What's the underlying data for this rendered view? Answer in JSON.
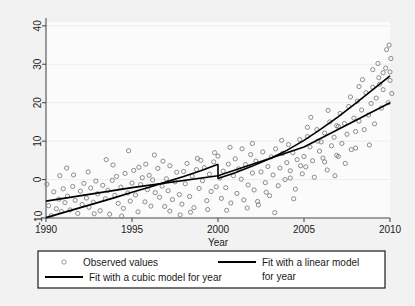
{
  "chart_data": {
    "type": "scatter",
    "title": "",
    "xlabel": "Year",
    "ylabel": "",
    "xlim": [
      1990,
      2010
    ],
    "ylim": [
      -10,
      41
    ],
    "grid": true,
    "grid_axis": "y",
    "legend_position": "bottom",
    "xticks": [
      1990,
      1995,
      2000,
      2005,
      2010
    ],
    "xtick_labels": [
      "1990",
      "1995",
      "2000",
      "2005",
      "2010"
    ],
    "yticks": [
      -10,
      0,
      10,
      20,
      30,
      40
    ],
    "ytick_labels": [
      "-10",
      "0",
      "10",
      "20",
      "30",
      "40"
    ],
    "series": [
      {
        "name": "Observed values",
        "type": "scatter",
        "marker": "open-circle",
        "color": "#808080",
        "points": [
          [
            1990.05,
            -1.2
          ],
          [
            1990.15,
            -6.8
          ],
          [
            1990.3,
            -9.4
          ],
          [
            1990.45,
            -3.2
          ],
          [
            1990.6,
            -7.6
          ],
          [
            1990.75,
            -5.1
          ],
          [
            1990.9,
            -8.3
          ],
          [
            1991.0,
            -2.4
          ],
          [
            1991.1,
            -6.0
          ],
          [
            1991.25,
            -4.3
          ],
          [
            1991.4,
            -7.9
          ],
          [
            1991.55,
            -1.8
          ],
          [
            1991.7,
            -5.4
          ],
          [
            1991.85,
            -8.8
          ],
          [
            1992.0,
            -3.0
          ],
          [
            1992.1,
            -6.5
          ],
          [
            1992.2,
            -1.0
          ],
          [
            1992.35,
            -4.8
          ],
          [
            1992.5,
            -7.2
          ],
          [
            1992.6,
            -2.2
          ],
          [
            1992.75,
            -5.9
          ],
          [
            1992.9,
            -0.4
          ],
          [
            1993.0,
            -3.7
          ],
          [
            1993.15,
            -8.1
          ],
          [
            1993.3,
            -1.5
          ],
          [
            1993.45,
            -5.0
          ],
          [
            1993.6,
            -2.8
          ],
          [
            1993.7,
            -9.0
          ],
          [
            1993.85,
            -0.2
          ],
          [
            1994.0,
            -4.1
          ],
          [
            1994.1,
            0.8
          ],
          [
            1994.2,
            -6.2
          ],
          [
            1994.35,
            -2.0
          ],
          [
            1994.5,
            -7.5
          ],
          [
            1994.6,
            1.6
          ],
          [
            1994.75,
            -3.5
          ],
          [
            1994.9,
            -5.6
          ],
          [
            1995.0,
            -0.9
          ],
          [
            1995.1,
            2.4
          ],
          [
            1995.2,
            -4.0
          ],
          [
            1995.35,
            -8.4
          ],
          [
            1995.5,
            -1.3
          ],
          [
            1995.6,
            0.5
          ],
          [
            1995.75,
            -5.8
          ],
          [
            1995.9,
            -2.6
          ],
          [
            1996.0,
            1.1
          ],
          [
            1996.1,
            -6.9
          ],
          [
            1996.2,
            -0.1
          ],
          [
            1996.35,
            -3.4
          ],
          [
            1996.5,
            2.9
          ],
          [
            1996.6,
            -4.6
          ],
          [
            1996.75,
            -1.7
          ],
          [
            1996.9,
            -7.0
          ],
          [
            1997.0,
            0.2
          ],
          [
            1997.1,
            -2.9
          ],
          [
            1997.2,
            3.6
          ],
          [
            1997.35,
            -5.2
          ],
          [
            1997.5,
            -0.6
          ],
          [
            1997.6,
            1.9
          ],
          [
            1997.75,
            -3.9
          ],
          [
            1997.9,
            -6.4
          ],
          [
            1998.0,
            2.1
          ],
          [
            1998.1,
            -1.1
          ],
          [
            1998.2,
            4.2
          ],
          [
            1998.35,
            -4.4
          ],
          [
            1998.5,
            0.9
          ],
          [
            1998.6,
            -7.3
          ],
          [
            1998.75,
            2.6
          ],
          [
            1998.9,
            -2.3
          ],
          [
            1999.0,
            5.0
          ],
          [
            1999.1,
            -0.3
          ],
          [
            1999.2,
            3.1
          ],
          [
            1999.35,
            -5.5
          ],
          [
            1999.5,
            1.4
          ],
          [
            1999.6,
            -3.1
          ],
          [
            1999.75,
            4.6
          ],
          [
            1999.9,
            -1.9
          ],
          [
            2000.0,
            6.1
          ],
          [
            2000.1,
            0.4
          ],
          [
            2000.2,
            -4.9
          ],
          [
            2000.3,
            2.2
          ],
          [
            2000.45,
            -2.1
          ],
          [
            2000.6,
            4.0
          ],
          [
            2000.75,
            -6.1
          ],
          [
            2000.9,
            1.0
          ],
          [
            2001.0,
            5.4
          ],
          [
            2001.1,
            -3.6
          ],
          [
            2001.2,
            2.8
          ],
          [
            2001.35,
            0.1
          ],
          [
            2001.5,
            -5.3
          ],
          [
            2001.6,
            3.9
          ],
          [
            2001.75,
            -1.4
          ],
          [
            2001.9,
            6.5
          ],
          [
            2002.0,
            1.7
          ],
          [
            2002.1,
            -2.7
          ],
          [
            2002.2,
            4.8
          ],
          [
            2002.35,
            -6.6
          ],
          [
            2002.5,
            2.0
          ],
          [
            2002.6,
            7.2
          ],
          [
            2002.75,
            -0.8
          ],
          [
            2002.9,
            3.4
          ],
          [
            2003.0,
            -4.2
          ],
          [
            2003.1,
            5.9
          ],
          [
            2003.2,
            1.2
          ],
          [
            2003.35,
            8.0
          ],
          [
            2003.5,
            -1.6
          ],
          [
            2003.6,
            3.0
          ],
          [
            2003.75,
            6.8
          ],
          [
            2003.9,
            0.0
          ],
          [
            2004.0,
            4.4
          ],
          [
            2004.1,
            9.1
          ],
          [
            2004.2,
            2.3
          ],
          [
            2004.35,
            7.0
          ],
          [
            2004.5,
            -2.5
          ],
          [
            2004.6,
            5.2
          ],
          [
            2004.75,
            10.4
          ],
          [
            2004.9,
            1.5
          ],
          [
            2005.0,
            6.0
          ],
          [
            2005.1,
            3.3
          ],
          [
            2005.2,
            11.2
          ],
          [
            2005.35,
            8.5
          ],
          [
            2005.5,
            4.9
          ],
          [
            2005.6,
            0.6
          ],
          [
            2005.75,
            13.0
          ],
          [
            2005.9,
            7.4
          ],
          [
            2006.0,
            9.8
          ],
          [
            2006.1,
            5.6
          ],
          [
            2006.2,
            12.1
          ],
          [
            2006.35,
            2.5
          ],
          [
            2006.5,
            15.0
          ],
          [
            2006.6,
            8.8
          ],
          [
            2006.75,
            11.0
          ],
          [
            2006.9,
            6.3
          ],
          [
            2007.0,
            13.8
          ],
          [
            2007.1,
            17.2
          ],
          [
            2007.2,
            9.4
          ],
          [
            2007.35,
            14.6
          ],
          [
            2007.5,
            11.8
          ],
          [
            2007.6,
            19.0
          ],
          [
            2007.75,
            7.8
          ],
          [
            2007.9,
            16.0
          ],
          [
            2008.0,
            12.5
          ],
          [
            2008.1,
            20.4
          ],
          [
            2008.2,
            15.2
          ],
          [
            2008.35,
            18.1
          ],
          [
            2008.5,
            13.0
          ],
          [
            2008.6,
            22.6
          ],
          [
            2008.75,
            16.8
          ],
          [
            2008.9,
            19.8
          ],
          [
            2009.0,
            24.0
          ],
          [
            2009.1,
            14.5
          ],
          [
            2009.2,
            21.2
          ],
          [
            2009.35,
            26.5
          ],
          [
            2009.5,
            18.6
          ],
          [
            2009.6,
            23.4
          ],
          [
            2009.75,
            29.0
          ],
          [
            2009.9,
            20.0
          ],
          [
            2010.0,
            25.8
          ],
          [
            2010.05,
            31.5
          ],
          [
            2010.1,
            22.4
          ],
          [
            1991.2,
            3.0
          ],
          [
            1993.5,
            5.2
          ],
          [
            1994.8,
            7.5
          ],
          [
            1996.3,
            6.4
          ],
          [
            1997.8,
            -9.2
          ],
          [
            1999.4,
            -7.8
          ],
          [
            2001.7,
            -7.4
          ],
          [
            2003.3,
            -8.6
          ],
          [
            2004.4,
            -5.0
          ],
          [
            2002.8,
            -3.3
          ],
          [
            2000.5,
            -8.0
          ],
          [
            2006.8,
            1.0
          ],
          [
            2007.4,
            4.2
          ],
          [
            2008.8,
            9.0
          ],
          [
            2009.8,
            33.8
          ],
          [
            2009.95,
            35.0
          ],
          [
            2009.3,
            30.2
          ],
          [
            2008.4,
            26.0
          ],
          [
            2007.7,
            21.5
          ],
          [
            2006.4,
            18.0
          ],
          [
            2005.4,
            16.2
          ],
          [
            2009.6,
            27.8
          ],
          [
            2008.2,
            24.2
          ],
          [
            2009.0,
            28.6
          ],
          [
            2006.9,
            14.0
          ],
          [
            2005.8,
            10.0
          ],
          [
            2010.0,
            28.0
          ],
          [
            2009.4,
            24.8
          ],
          [
            1992.45,
            2.0
          ],
          [
            1995.8,
            4.0
          ],
          [
            1998.8,
            5.5
          ],
          [
            2002.3,
            -5.7
          ],
          [
            2004.8,
            3.6
          ],
          [
            2001.4,
            8.0
          ],
          [
            1999.8,
            7.0
          ],
          [
            1993.9,
            3.8
          ],
          [
            1991.6,
            1.2
          ],
          [
            1996.8,
            4.8
          ],
          [
            2003.7,
            10.2
          ],
          [
            2005.2,
            13.6
          ],
          [
            2007.0,
            6.0
          ],
          [
            2008.0,
            8.2
          ],
          [
            2006.2,
            4.6
          ],
          [
            2004.2,
            0.4
          ],
          [
            1990.8,
            1.0
          ],
          [
            1992.8,
            -8.9
          ],
          [
            1994.4,
            -9.5
          ],
          [
            1997.2,
            -8.2
          ],
          [
            2000.7,
            8.4
          ],
          [
            2002.0,
            9.4
          ],
          [
            1998.4,
            -8.5
          ],
          [
            1995.4,
            3.2
          ]
        ]
      },
      {
        "name": "Fit with a cubic model for year",
        "type": "line",
        "color": "#000000",
        "note": "piecewise cubic with discontinuity at year 2000",
        "segment_a": [
          [
            1990,
            -9.9
          ],
          [
            1991,
            -8.6
          ],
          [
            1992,
            -7.3
          ],
          [
            1993,
            -6.0
          ],
          [
            1994,
            -4.7
          ],
          [
            1995,
            -3.3
          ],
          [
            1996,
            -2.0
          ],
          [
            1997,
            -0.6
          ],
          [
            1998,
            0.8
          ],
          [
            1999,
            2.3
          ],
          [
            2000,
            4.0
          ]
        ],
        "segment_b": [
          [
            2000,
            0.3
          ],
          [
            2001,
            1.8
          ],
          [
            2002,
            3.5
          ],
          [
            2003,
            5.4
          ],
          [
            2004,
            7.6
          ],
          [
            2005,
            10.2
          ],
          [
            2006,
            13.2
          ],
          [
            2007,
            16.4
          ],
          [
            2008,
            19.8
          ],
          [
            2009,
            23.4
          ],
          [
            2010,
            27.0
          ]
        ]
      },
      {
        "name": "Fit with a linear model for year",
        "type": "line",
        "color": "#000000",
        "points": [
          [
            1990,
            -5.6
          ],
          [
            1995,
            -2.1
          ],
          [
            2000,
            1.0
          ],
          [
            2005,
            8.5
          ],
          [
            2010,
            20.0
          ]
        ]
      }
    ]
  },
  "legend": {
    "entries": [
      {
        "label": "Observed values",
        "marker": "open-circle"
      },
      {
        "label": "Fit with a linear model for year",
        "marker": "line"
      },
      {
        "label": "Fit with a cubic model for year",
        "marker": "line"
      }
    ]
  },
  "colors": {
    "background": "#f2f2f2",
    "plot_background": "#fbfbfb",
    "axis": "#4d4d4d",
    "grid": "#ededed",
    "marker": "#8c8c8c",
    "fit_line": "#000000",
    "legend_border": "#1a1a1a",
    "text": "#1a1a1a"
  }
}
